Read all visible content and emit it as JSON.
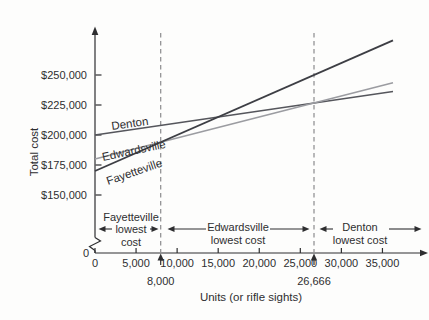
{
  "figure": {
    "background": "#fdfdfc",
    "ink_color": "#2e2e30"
  },
  "chart_data": {
    "type": "line",
    "title": "",
    "xlabel": "Units (or rifle sights)",
    "ylabel": "Total cost",
    "x_origin_label": "0",
    "y_origin_label": "0",
    "xlim": [
      0,
      40000
    ],
    "ylim_visible": [
      150000,
      262500
    ],
    "grid": false,
    "axis_break_on_y": true,
    "x_ticks": [
      {
        "value": 0,
        "label": "0"
      },
      {
        "value": 5000,
        "label": "5,000"
      },
      {
        "value": 10000,
        "label": "10,000"
      },
      {
        "value": 15000,
        "label": "15,000"
      },
      {
        "value": 20000,
        "label": "20,000"
      },
      {
        "value": 25000,
        "label": "25,000"
      },
      {
        "value": 30000,
        "label": "30,000"
      },
      {
        "value": 35000,
        "label": "35,000"
      }
    ],
    "y_ticks": [
      {
        "value": 150000,
        "label": "$150,000"
      },
      {
        "value": 175000,
        "label": "$175,000"
      },
      {
        "value": 200000,
        "label": "$200,000"
      },
      {
        "value": 225000,
        "label": "$225,000"
      },
      {
        "value": 250000,
        "label": "$250,000"
      }
    ],
    "series": [
      {
        "name": "Denton",
        "fixed_cost": 200000,
        "variable_cost_per_unit": 1.0,
        "points": [
          {
            "x": 0,
            "y": 200000
          },
          {
            "x": 35000,
            "y": 235000
          }
        ],
        "color": "#55565c"
      },
      {
        "name": "Edwardsville",
        "fixed_cost": 180000,
        "variable_cost_per_unit": 1.75,
        "points": [
          {
            "x": 0,
            "y": 180000
          },
          {
            "x": 35000,
            "y": 241250
          }
        ],
        "color": "#9b9ca1"
      },
      {
        "name": "Fayetteville",
        "fixed_cost": 170000,
        "variable_cost_per_unit": 3.0,
        "points": [
          {
            "x": 0,
            "y": 170000
          },
          {
            "x": 35000,
            "y": 275000
          }
        ],
        "color": "#3d3e44"
      }
    ],
    "crossover_points": [
      {
        "units": 8000,
        "label": "8,000"
      },
      {
        "units": 26666,
        "label": "26,666"
      }
    ],
    "regions": [
      {
        "lines": [
          "Fayetteville",
          "lowest",
          "cost"
        ],
        "from_units": 0,
        "to_units": 8000
      },
      {
        "lines": [
          "Edwardsville",
          "lowest cost"
        ],
        "from_units": 8000,
        "to_units": 26666
      },
      {
        "lines": [
          "Denton",
          "lowest cost"
        ],
        "from_units": 26666,
        "to_units": null
      }
    ],
    "dashed_line_color": "#8b8b8d",
    "legend": "labels-on-lines"
  }
}
